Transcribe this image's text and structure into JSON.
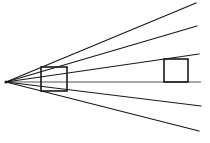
{
  "diagram": {
    "type": "line-diagram",
    "canvas": {
      "width": 210,
      "height": 143,
      "background": "#ffffff"
    },
    "colors": {
      "ray_stroke": "#1a1a1a",
      "horizon_stroke": "#555555",
      "box_stroke": "#1a1a1a",
      "vanishing_point": "#1a1a1a"
    },
    "vanishing_point": {
      "x": 6,
      "y": 82,
      "label": "VP"
    },
    "horizon": {
      "label": "horizon line",
      "x1": 6,
      "y1": 82,
      "x2": 201,
      "y2": 82
    },
    "rays": [
      {
        "name": "ray-upper-outer",
        "x1": 6,
        "y1": 82,
        "x2": 196,
        "y2": 3
      },
      {
        "name": "ray-upper-inner",
        "x1": 6,
        "y1": 82,
        "x2": 197,
        "y2": 26
      },
      {
        "name": "ray-upper-box",
        "x1": 6,
        "y1": 82,
        "x2": 199,
        "y2": 54
      },
      {
        "name": "ray-lower-inner",
        "x1": 6,
        "y1": 82,
        "x2": 201,
        "y2": 106
      },
      {
        "name": "ray-lower-outer",
        "x1": 6,
        "y1": 82,
        "x2": 199,
        "y2": 131
      }
    ],
    "shapes": [
      {
        "name": "near-rectangle",
        "label": "near square",
        "left": 41,
        "top": 67,
        "right": 67,
        "bottom": 91,
        "width": 26,
        "height": 24,
        "closed": true
      },
      {
        "name": "far-rectangle",
        "label": "far square",
        "left": 164,
        "top": 59,
        "right": 188,
        "bottom": 82,
        "width": 24,
        "height": 23,
        "closed": true
      }
    ],
    "ray_count": 5,
    "shape_count": 2
  }
}
